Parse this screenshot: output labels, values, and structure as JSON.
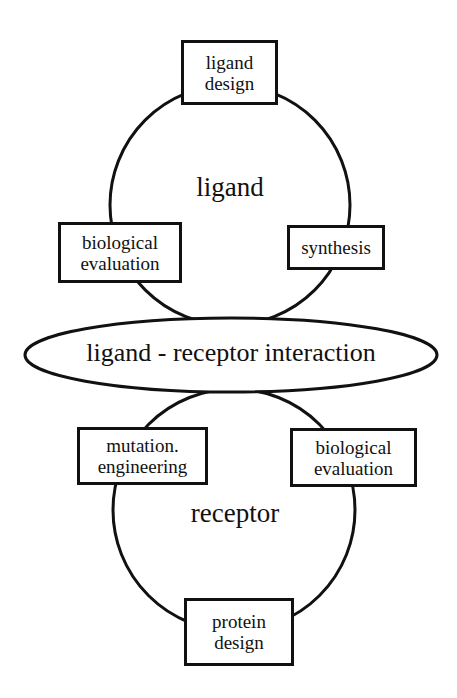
{
  "diagram": {
    "upper_cycle": {
      "label": "ligand",
      "nodes": [
        {
          "id": "ligand-design",
          "line1": "ligand",
          "line2": "design"
        },
        {
          "id": "synthesis",
          "line1": "synthesis",
          "line2": ""
        },
        {
          "id": "biological-evaluation-ligand",
          "line1": "biological",
          "line2": "evaluation"
        }
      ]
    },
    "interaction": {
      "label": "ligand - receptor interaction"
    },
    "lower_cycle": {
      "label": "receptor",
      "nodes": [
        {
          "id": "mutation-engineering",
          "line1": "mutation.",
          "line2": "engineering"
        },
        {
          "id": "biological-evaluation-receptor",
          "line1": "biological",
          "line2": "evaluation"
        },
        {
          "id": "protein-design",
          "line1": "protein",
          "line2": "design"
        }
      ]
    },
    "colors": {
      "stroke": "#111111",
      "background": "#ffffff"
    }
  }
}
